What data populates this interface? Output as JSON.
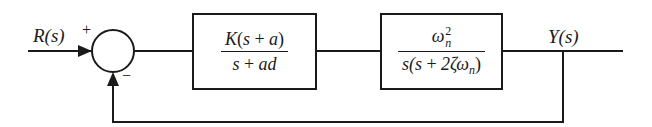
{
  "diagram": {
    "type": "feedback-control-block-diagram",
    "input_label": "R(s)",
    "output_label": "Y(s)",
    "summing_junction": {
      "plus_sign": "+",
      "minus_sign": "−"
    },
    "blocks": [
      {
        "name": "controller",
        "numerator": {
          "coef": "K",
          "open": "(",
          "var": "s",
          "op": " + ",
          "param": "a",
          "close": ")"
        },
        "denominator": {
          "var": "s",
          "op": " + ",
          "param": "ad"
        }
      },
      {
        "name": "plant",
        "numerator": {
          "base": "ω",
          "sup": "2",
          "sub": "n"
        },
        "denominator": {
          "pre": "s(s",
          "op": " + ",
          "coef": "2ζ",
          "base": "ω",
          "sub": "n",
          "close": ")"
        }
      }
    ],
    "feedback": "unity negative feedback"
  },
  "colors": {
    "line": "#1a1a1a",
    "background": "#ffffff"
  }
}
